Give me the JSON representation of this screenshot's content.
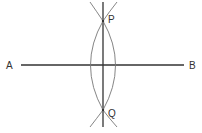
{
  "diagram": {
    "type": "perpendicular-bisector-construction",
    "colors": {
      "line": "#333333",
      "arc": "#777777",
      "background": "#ffffff"
    },
    "labels": {
      "a": "A",
      "b": "B",
      "p": "P",
      "q": "Q"
    },
    "points": {
      "A": [
        21,
        65
      ],
      "B": [
        184,
        65
      ],
      "P": [
        103,
        21
      ],
      "Q": [
        103,
        110
      ]
    }
  }
}
